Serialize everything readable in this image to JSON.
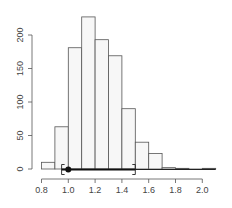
{
  "chart_data": {
    "type": "bar",
    "subtype": "histogram",
    "title": "",
    "xlabel": "",
    "ylabel": "",
    "bin_edges": [
      0.8,
      0.9,
      1.0,
      1.1,
      1.2,
      1.3,
      1.4,
      1.5,
      1.6,
      1.7,
      1.8,
      1.9,
      2.0,
      2.1
    ],
    "categories": [
      "0.8-0.9",
      "0.9-1.0",
      "1.0-1.1",
      "1.1-1.2",
      "1.2-1.3",
      "1.3-1.4",
      "1.4-1.5",
      "1.5-1.6",
      "1.6-1.7",
      "1.7-1.8",
      "1.8-1.9",
      "1.9-2.0",
      "2.0-2.1"
    ],
    "values": [
      10,
      63,
      181,
      227,
      193,
      169,
      90,
      40,
      23,
      2,
      1,
      0,
      1
    ],
    "xlim": [
      0.8,
      2.1
    ],
    "ylim": [
      0,
      230
    ],
    "x_ticks": [
      0.8,
      1.0,
      1.2,
      1.4,
      1.6,
      1.8,
      2.0
    ],
    "x_tick_labels": [
      "0.8",
      "1.0",
      "1.2",
      "1.4",
      "1.6",
      "1.8",
      "2.0"
    ],
    "y_ticks": [
      0,
      50,
      100,
      150,
      200
    ],
    "y_tick_labels": [
      "0",
      "50",
      "100",
      "150",
      "200"
    ],
    "grid": false,
    "legend": null,
    "annotations": {
      "interval": {
        "lower": 0.95,
        "upper": 1.5,
        "point": 1.0,
        "style": "bracket interval with point estimate"
      },
      "baseline_line": {
        "from": 1.0,
        "to": 2.1
      }
    },
    "colors": {
      "bar_fill": "#f7f7f7",
      "bar_stroke": "#555555",
      "axis": "#555555",
      "point": "#111111"
    }
  }
}
